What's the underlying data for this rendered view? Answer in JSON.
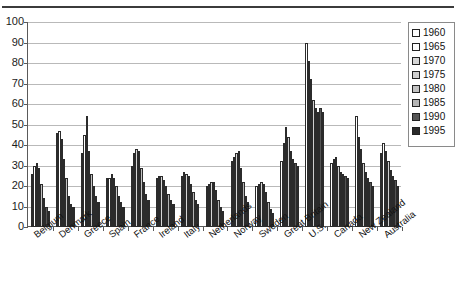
{
  "chart_data": {
    "type": "bar",
    "title": "",
    "xlabel": "",
    "ylabel": "",
    "ylim": [
      0,
      100
    ],
    "ytick_labels": [
      "0",
      "10",
      "20",
      "30",
      "40",
      "50",
      "60",
      "70",
      "80",
      "90",
      "100"
    ],
    "grid": true,
    "legend_position": "right",
    "categories": [
      "Belgium",
      "Denmark",
      "Greece",
      "Spain",
      "France",
      "Ireland",
      "Italy",
      "Netherlands",
      "Norway",
      "Sweden",
      "Great Britain",
      "U.S.",
      "Canada",
      "New Zealand",
      "Australia"
    ],
    "series": [
      {
        "name": "1960",
        "color": "#ffffff",
        "values": [
          26,
          46,
          36,
          24,
          30,
          24,
          25,
          20,
          32,
          20,
          32,
          90,
          31,
          54,
          36
        ]
      },
      {
        "name": "1965",
        "color": "#ffffff",
        "values": [
          30,
          47,
          45,
          24,
          36,
          25,
          27,
          21,
          34,
          21,
          41,
          81,
          33,
          44,
          41
        ]
      },
      {
        "name": "1970",
        "color": "#d6d6d6",
        "values": [
          31,
          43,
          54,
          26,
          38,
          25,
          26,
          22,
          36,
          22,
          49,
          72,
          34,
          38,
          37
        ]
      },
      {
        "name": "1975",
        "color": "#cfcfcf",
        "values": [
          29,
          33,
          37,
          24,
          37,
          23,
          25,
          22,
          37,
          21,
          44,
          62,
          30,
          31,
          32
        ]
      },
      {
        "name": "1980",
        "color": "#c2c2c2",
        "values": [
          21,
          24,
          26,
          20,
          29,
          20,
          21,
          18,
          29,
          17,
          37,
          58,
          27,
          27,
          28
        ]
      },
      {
        "name": "1985",
        "color": "#b4b4b4",
        "values": [
          14,
          15,
          20,
          15,
          22,
          16,
          17,
          13,
          22,
          12,
          33,
          56,
          26,
          24,
          25
        ]
      },
      {
        "name": "1990",
        "color": "#555555",
        "values": [
          10,
          11,
          15,
          12,
          16,
          13,
          13,
          10,
          15,
          9,
          31,
          58,
          25,
          22,
          23
        ]
      },
      {
        "name": "1995",
        "color": "#2a2a2a",
        "values": [
          8,
          10,
          12,
          10,
          13,
          11,
          11,
          8,
          12,
          7,
          30,
          56,
          24,
          20,
          20
        ]
      }
    ]
  },
  "legend": {
    "items": [
      {
        "label": "1960"
      },
      {
        "label": "1965"
      },
      {
        "label": "1970"
      },
      {
        "label": "1975"
      },
      {
        "label": "1980"
      },
      {
        "label": "1985"
      },
      {
        "label": "1990"
      },
      {
        "label": "1995"
      }
    ]
  }
}
